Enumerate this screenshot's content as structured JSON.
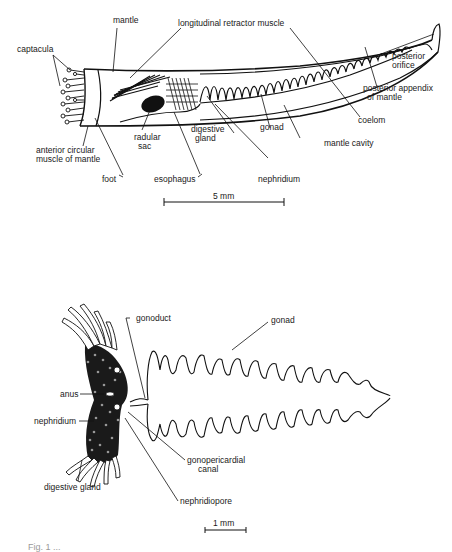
{
  "figure_top": {
    "title": "Scaphopod body, lateral view",
    "labels": {
      "mantle": "mantle",
      "longitudinal_retractor_muscle": "longitudinal retractor muscle",
      "captacula": "captacula",
      "posterior_orifice_1": "posterior",
      "posterior_orifice_2": "orifice",
      "posterior_appendix_1": "posterior appendix",
      "posterior_appendix_2": "of mantle",
      "coelom": "coelom",
      "gonad": "gonad",
      "mantle_cavity": "mantle cavity",
      "digestive_gland_1": "digestive",
      "digestive_gland_2": "gland",
      "radular_sac_1": "radular",
      "radular_sac_2": "sac",
      "anterior_circular_1": "anterior circular",
      "anterior_circular_2": "muscle of mantle",
      "foot": "foot",
      "esophagus": "esophagus",
      "nephridium": "nephridium"
    },
    "scale_bar": "5 mm"
  },
  "figure_bottom": {
    "labels": {
      "gonoduct": "gonoduct",
      "gonad": "gonad",
      "anus": "anus",
      "nephridium": "nephridium",
      "gonopericardial_1": "gonopericardial",
      "gonopericardial_2": "canal",
      "digestive_gland": "digestive gland",
      "nephridiopore": "nephridiopore"
    },
    "scale_bar": "1 mm"
  },
  "caption": "Fig. 1  ..."
}
